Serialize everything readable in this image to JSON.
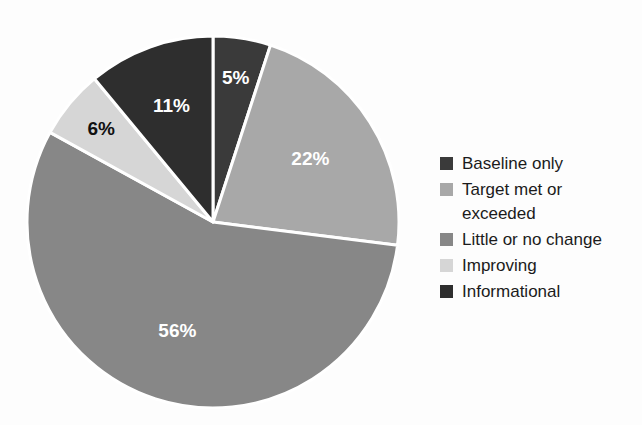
{
  "chart_data": {
    "type": "pie",
    "title": "",
    "subtitle": "",
    "xlabel": "",
    "ylabel": "",
    "grid": false,
    "legend_position": "right",
    "start_angle_deg": 0,
    "direction": "clockwise",
    "categories": [
      "Baseline only",
      "Target met or exceeded",
      "Little or no change",
      "Improving",
      "Informational"
    ],
    "values": [
      5,
      22,
      56,
      6,
      11
    ],
    "value_unit": "%",
    "data_labels": [
      "5%",
      "22%",
      "56%",
      "6%",
      "11%"
    ],
    "colors": [
      "#3a3a3a",
      "#a8a8a8",
      "#878787",
      "#d6d6d6",
      "#2e2e2e"
    ],
    "label_text_colors": [
      "#ffffff",
      "#ffffff",
      "#ffffff",
      "#111111",
      "#ffffff"
    ],
    "separator_color": "#ffffff",
    "background_color": "#fdfdfd",
    "slices": [
      {
        "label": "Baseline only",
        "value": 5,
        "data_label": "5%",
        "color": "#3a3a3a",
        "label_color": "#ffffff"
      },
      {
        "label": "Target met or exceeded",
        "value": 22,
        "data_label": "22%",
        "color": "#a8a8a8",
        "label_color": "#ffffff"
      },
      {
        "label": "Little or no change",
        "value": 56,
        "data_label": "56%",
        "color": "#878787",
        "label_color": "#ffffff"
      },
      {
        "label": "Improving",
        "value": 6,
        "data_label": "6%",
        "color": "#d6d6d6",
        "label_color": "#111111"
      },
      {
        "label": "Informational",
        "value": 11,
        "data_label": "11%",
        "color": "#2e2e2e",
        "label_color": "#ffffff"
      }
    ]
  },
  "legend": {
    "items": [
      {
        "label": "Baseline only",
        "color": "#3a3a3a"
      },
      {
        "label": "Target met or\nexceeded",
        "color": "#a8a8a8"
      },
      {
        "label": "Little or no change",
        "color": "#878787"
      },
      {
        "label": "Improving",
        "color": "#d6d6d6"
      },
      {
        "label": "Informational",
        "color": "#2e2e2e"
      }
    ]
  }
}
